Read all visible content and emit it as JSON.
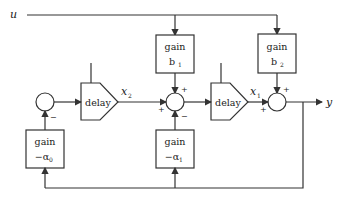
{
  "diagram": {
    "input_label": "u",
    "output_label": "y",
    "blocks": {
      "gain_b1": {
        "title": "gain",
        "param": "b",
        "sub": "1"
      },
      "gain_b2": {
        "title": "gain",
        "param": "b",
        "sub": "2"
      },
      "gain_a0": {
        "title": "gain",
        "param": "−α",
        "sub": "0"
      },
      "gain_a1": {
        "title": "gain",
        "param": "−α",
        "sub": "1"
      },
      "delay_1": {
        "label": "delay"
      },
      "delay_2": {
        "label": "delay"
      }
    },
    "states": {
      "x2": {
        "name": "x",
        "sub": "2"
      },
      "x1": {
        "name": "x",
        "sub": "1"
      }
    },
    "signs": {
      "sum_left_bottom": "−",
      "sum_mid_top": "+",
      "sum_mid_left": "+",
      "sum_mid_bottom": "−",
      "sum_right_top": "+",
      "sum_right_left": "+"
    }
  }
}
